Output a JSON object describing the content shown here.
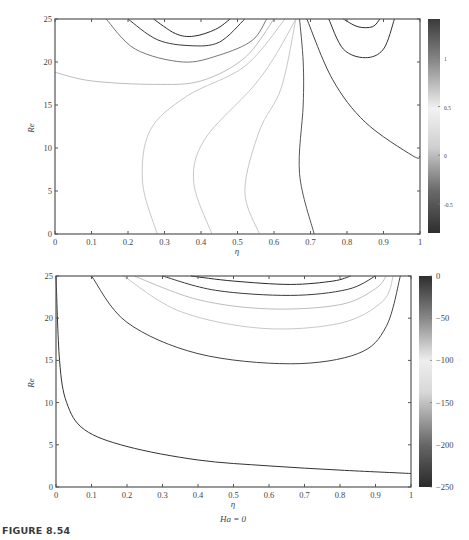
{
  "figure_caption": "FIGURE 8.54",
  "chart_data": [
    {
      "type": "contour",
      "title": "",
      "xlabel": "η",
      "ylabel": "Re",
      "xlim": [
        0,
        1
      ],
      "ylim": [
        0,
        25
      ],
      "xticks": [
        "0",
        "0.1",
        "0.2",
        "0.3",
        "0.4",
        "0.5",
        "0.6",
        "0.7",
        "0.8",
        "0.9",
        "1"
      ],
      "yticks": [
        "0",
        "5",
        "10",
        "15",
        "20",
        "25"
      ],
      "grid": false,
      "colorbar": {
        "ticks": [
          "1",
          "0.5",
          "0",
          "-0.5"
        ],
        "range": [
          -0.8,
          1.4
        ],
        "colormap": "gray (dark-light-dark)"
      },
      "contours": [
        {
          "level_shade": "#2a2a2a",
          "points": [
            [
              0.27,
              25
            ],
            [
              0.33,
              23.3
            ],
            [
              0.38,
              23.0
            ],
            [
              0.44,
              23.8
            ],
            [
              0.48,
              25
            ]
          ]
        },
        {
          "level_shade": "#3a3a3a",
          "points": [
            [
              0.2,
              25
            ],
            [
              0.28,
              22.6
            ],
            [
              0.37,
              21.9
            ],
            [
              0.45,
              22.3
            ],
            [
              0.52,
              25
            ]
          ]
        },
        {
          "level_shade": "#777777",
          "points": [
            [
              0.14,
              25
            ],
            [
              0.22,
              21.5
            ],
            [
              0.35,
              20.0
            ],
            [
              0.45,
              20.8
            ],
            [
              0.54,
              22.5
            ],
            [
              0.58,
              25
            ]
          ]
        },
        {
          "level_shade": "#bdbdbd",
          "points": [
            [
              0.0,
              18.8
            ],
            [
              0.1,
              17.8
            ],
            [
              0.27,
              17.4
            ],
            [
              0.4,
              17.8
            ],
            [
              0.52,
              20.5
            ],
            [
              0.6,
              25
            ]
          ]
        },
        {
          "level_shade": "#c8c8c8",
          "points": [
            [
              0.28,
              0
            ],
            [
              0.24,
              6
            ],
            [
              0.26,
              12
            ],
            [
              0.36,
              16
            ],
            [
              0.52,
              19.5
            ],
            [
              0.63,
              25
            ]
          ]
        },
        {
          "level_shade": "#c8c8c8",
          "points": [
            [
              0.43,
              0
            ],
            [
              0.38,
              6
            ],
            [
              0.41,
              11
            ],
            [
              0.54,
              17
            ],
            [
              0.6,
              20.5
            ],
            [
              0.66,
              25
            ]
          ]
        },
        {
          "level_shade": "#c8c8c8",
          "points": [
            [
              0.56,
              0
            ],
            [
              0.52,
              5
            ],
            [
              0.56,
              12
            ],
            [
              0.62,
              17
            ],
            [
              0.66,
              25
            ]
          ]
        },
        {
          "level_shade": "#555555",
          "points": [
            [
              0.71,
              0
            ],
            [
              0.67,
              7
            ],
            [
              0.68,
              15
            ],
            [
              0.68,
              20
            ],
            [
              0.67,
              25
            ]
          ]
        },
        {
          "level_shade": "#444444",
          "points": [
            [
              0.69,
              25
            ],
            [
              0.76,
              18
            ],
            [
              0.85,
              13
            ],
            [
              0.98,
              9.1
            ],
            [
              1.0,
              9.1
            ]
          ]
        },
        {
          "level_shade": "#333333",
          "points": [
            [
              0.75,
              25
            ],
            [
              0.79,
              21.5
            ],
            [
              0.85,
              20.5
            ],
            [
              0.9,
              21.5
            ],
            [
              0.93,
              25
            ]
          ]
        },
        {
          "level_shade": "#2a2a2a",
          "points": [
            [
              0.79,
              25
            ],
            [
              0.83,
              24.1
            ],
            [
              0.87,
              24.1
            ],
            [
              0.89,
              25
            ]
          ]
        }
      ]
    },
    {
      "type": "contour",
      "title": "",
      "xlabel": "η",
      "ylabel": "Re",
      "annotation": "Ha = 0",
      "xlim": [
        0,
        1
      ],
      "ylim": [
        0,
        25
      ],
      "xticks": [
        "0",
        "0.1",
        "0.2",
        "0.3",
        "0.4",
        "0.5",
        "0.6",
        "0.7",
        "0.8",
        "0.9",
        "1"
      ],
      "yticks": [
        "0",
        "5",
        "10",
        "15",
        "20",
        "25"
      ],
      "grid": false,
      "colorbar": {
        "ticks": [
          "0",
          "-50",
          "-100",
          "-150",
          "-200",
          "-250"
        ],
        "range": [
          -250,
          0
        ],
        "colormap": "gray (dark-light-dark)"
      },
      "contours": [
        {
          "level_shade": "#2a2a2a",
          "points": [
            [
              0.38,
              25
            ],
            [
              0.5,
              24.4
            ],
            [
              0.66,
              24.0
            ],
            [
              0.78,
              24.4
            ],
            [
              0.83,
              25
            ]
          ]
        },
        {
          "level_shade": "#3a3a3a",
          "points": [
            [
              0.3,
              25
            ],
            [
              0.45,
              23.3
            ],
            [
              0.66,
              22.7
            ],
            [
              0.82,
              23.4
            ],
            [
              0.9,
              25
            ]
          ]
        },
        {
          "level_shade": "#bdbdbd",
          "points": [
            [
              0.22,
              25
            ],
            [
              0.4,
              22.2
            ],
            [
              0.6,
              21.1
            ],
            [
              0.8,
              21.6
            ],
            [
              0.9,
              23.5
            ],
            [
              0.93,
              25
            ]
          ]
        },
        {
          "level_shade": "#c8c8c8",
          "points": [
            [
              0.19,
              25
            ],
            [
              0.35,
              20.8
            ],
            [
              0.58,
              18.8
            ],
            [
              0.8,
              19.4
            ],
            [
              0.92,
              22
            ],
            [
              0.95,
              25
            ]
          ]
        },
        {
          "level_shade": "#444444",
          "points": [
            [
              0.1,
              25
            ],
            [
              0.2,
              19.5
            ],
            [
              0.4,
              15.8
            ],
            [
              0.66,
              14.6
            ],
            [
              0.85,
              15.8
            ],
            [
              0.93,
              19
            ],
            [
              0.97,
              25
            ]
          ]
        },
        {
          "level_shade": "#333333",
          "points": [
            [
              0.0,
              25
            ],
            [
              0.01,
              15
            ],
            [
              0.03,
              10
            ],
            [
              0.08,
              6.8
            ],
            [
              0.2,
              4.8
            ],
            [
              0.4,
              3.2
            ],
            [
              0.6,
              2.5
            ],
            [
              0.8,
              2.0
            ],
            [
              1.0,
              1.6
            ]
          ]
        }
      ]
    }
  ]
}
